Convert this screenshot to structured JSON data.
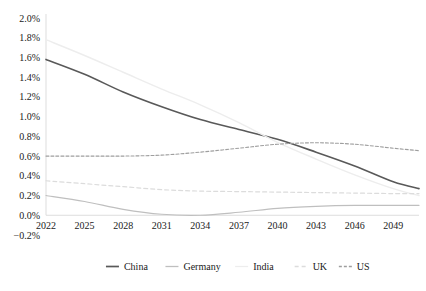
{
  "chart_data": {
    "type": "line",
    "title": "",
    "subtitle": "",
    "xlabel": "",
    "ylabel": "",
    "grid": false,
    "legend_position": "bottom",
    "x": [
      2022,
      2025,
      2028,
      2031,
      2034,
      2037,
      2040,
      2043,
      2046,
      2049,
      2051
    ],
    "xtick_labels": [
      "2022",
      "2025",
      "2028",
      "2031",
      "2034",
      "2037",
      "2040",
      "2043",
      "2046",
      "2049"
    ],
    "xticks": [
      2022,
      2025,
      2028,
      2031,
      2034,
      2037,
      2040,
      2043,
      2046,
      2049
    ],
    "xlim": [
      2022,
      2051
    ],
    "ylim": [
      -0.2,
      2.0
    ],
    "ytick_labels": [
      "2.0%",
      "1.8%",
      "1.6%",
      "1.4%",
      "1.2%",
      "1.0%",
      "0.8%",
      "0.6%",
      "0.4%",
      "0.2%",
      "0.0%",
      "-0.2%"
    ],
    "yticks": [
      2.0,
      1.8,
      1.6,
      1.4,
      1.2,
      1.0,
      0.8,
      0.6,
      0.4,
      0.2,
      0.0,
      -0.2
    ],
    "y_unit": "%",
    "series": [
      {
        "name": "China",
        "color": "#595959",
        "dash": "none",
        "width": 1.6,
        "values": [
          1.58,
          1.43,
          1.25,
          1.1,
          0.97,
          0.87,
          0.77,
          0.64,
          0.5,
          0.34,
          0.27
        ]
      },
      {
        "name": "Germany",
        "color": "#bfbfbf",
        "dash": "none",
        "width": 1.1,
        "values": [
          0.2,
          0.14,
          0.06,
          0.01,
          0.0,
          0.03,
          0.07,
          0.09,
          0.1,
          0.1,
          0.1
        ]
      },
      {
        "name": "India",
        "color": "#ededed",
        "dash": "none",
        "width": 1.4,
        "values": [
          1.78,
          1.62,
          1.45,
          1.28,
          1.12,
          0.94,
          0.74,
          0.57,
          0.41,
          0.27,
          0.2
        ]
      },
      {
        "name": "UK",
        "color": "#dcdcdc",
        "dash": "4 3",
        "width": 1.2,
        "values": [
          0.35,
          0.32,
          0.29,
          0.26,
          0.245,
          0.24,
          0.235,
          0.23,
          0.225,
          0.22,
          0.22
        ]
      },
      {
        "name": "US",
        "color": "#9e9e9e",
        "dash": "3 2",
        "width": 1.1,
        "values": [
          0.6,
          0.6,
          0.6,
          0.61,
          0.64,
          0.68,
          0.72,
          0.735,
          0.72,
          0.68,
          0.655
        ]
      }
    ],
    "legend": [
      {
        "label": "China",
        "color": "#595959",
        "dash": "none"
      },
      {
        "label": "Germany",
        "color": "#bfbfbf",
        "dash": "none"
      },
      {
        "label": "India",
        "color": "#ededed",
        "dash": "none"
      },
      {
        "label": "UK",
        "color": "#dcdcdc",
        "dash": "4 3"
      },
      {
        "label": "US",
        "color": "#9e9e9e",
        "dash": "3 2"
      }
    ]
  },
  "plot_geometry": {
    "left": 46,
    "right": 419,
    "top": 18,
    "bottom": 235
  }
}
